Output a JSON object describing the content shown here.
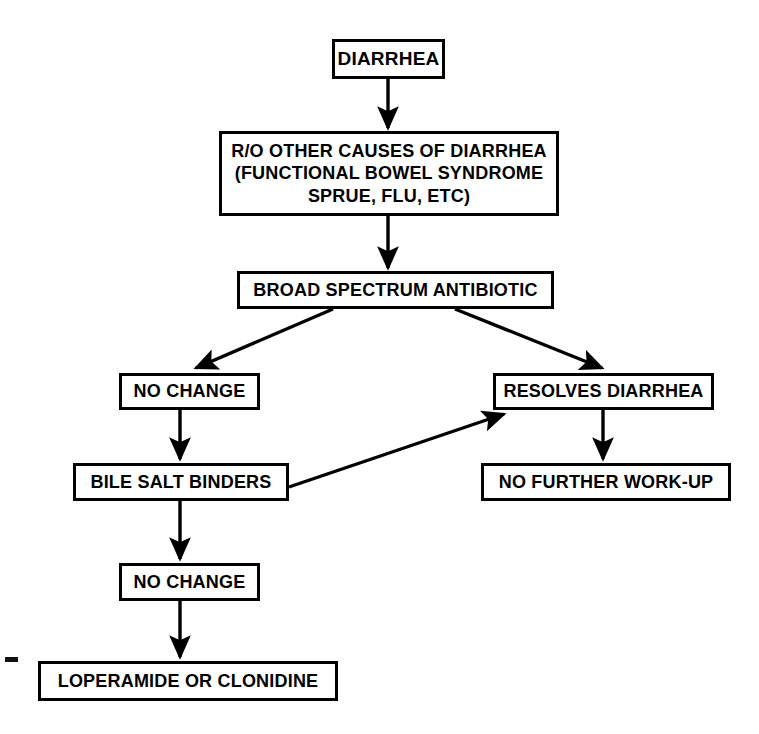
{
  "diagram": {
    "type": "flowchart",
    "background_color": "#ffffff",
    "line_color": "#000000",
    "text_color": "#000000",
    "nodes": [
      {
        "id": "diarrhea",
        "label": "DIARRHEA",
        "x": 332,
        "y": 39,
        "w": 113,
        "h": 40,
        "font_size": 19
      },
      {
        "id": "rule-out",
        "label": "R/O OTHER CAUSES OF DIARRHEA\n(FUNCTIONAL BOWEL SYNDROME\nSPRUE, FLU, ETC)",
        "x": 219,
        "y": 131,
        "w": 340,
        "h": 85,
        "font_size": 18
      },
      {
        "id": "broad-spectrum-antibiotic",
        "label": "BROAD SPECTRUM ANTIBIOTIC",
        "x": 237,
        "y": 271,
        "w": 317,
        "h": 38,
        "font_size": 18
      },
      {
        "id": "no-change-1",
        "label": "NO CHANGE",
        "x": 119,
        "y": 373,
        "w": 141,
        "h": 37,
        "font_size": 18
      },
      {
        "id": "resolves-diarrhea",
        "label": "RESOLVES DIARRHEA",
        "x": 493,
        "y": 373,
        "w": 221,
        "h": 37,
        "font_size": 18
      },
      {
        "id": "bile-salt-binders",
        "label": "BILE SALT BINDERS",
        "x": 73,
        "y": 463,
        "w": 216,
        "h": 38,
        "font_size": 18
      },
      {
        "id": "no-further-work-up",
        "label": "NO FURTHER WORK-UP",
        "x": 481,
        "y": 463,
        "w": 250,
        "h": 38,
        "font_size": 18
      },
      {
        "id": "no-change-2",
        "label": "NO CHANGE",
        "x": 119,
        "y": 563,
        "w": 141,
        "h": 38,
        "font_size": 18
      },
      {
        "id": "loperamide-or-clonidine",
        "label": "LOPERAMIDE OR CLONIDINE",
        "x": 38,
        "y": 661,
        "w": 300,
        "h": 40,
        "font_size": 18
      }
    ],
    "edges": [
      {
        "id": "edge-diarrhea-to-rule-out",
        "from": "diarrhea",
        "to": "rule-out",
        "x1": 388,
        "y1": 79,
        "x2": 388,
        "y2": 128
      },
      {
        "id": "edge-rule-out-to-antibiotic",
        "from": "rule-out",
        "to": "broad-spectrum-antibiotic",
        "x1": 388,
        "y1": 216,
        "x2": 388,
        "y2": 268
      },
      {
        "id": "edge-antibiotic-to-no-change",
        "from": "broad-spectrum-antibiotic",
        "to": "no-change-1",
        "x1": 333,
        "y1": 309,
        "x2": 196,
        "y2": 368
      },
      {
        "id": "edge-antibiotic-to-resolves",
        "from": "broad-spectrum-antibiotic",
        "to": "resolves-diarrhea",
        "x1": 455,
        "y1": 309,
        "x2": 602,
        "y2": 368
      },
      {
        "id": "edge-no-change-to-bile-salt",
        "from": "no-change-1",
        "to": "bile-salt-binders",
        "x1": 180,
        "y1": 410,
        "x2": 180,
        "y2": 459
      },
      {
        "id": "edge-bile-salt-to-resolves",
        "from": "bile-salt-binders",
        "to": "resolves-diarrhea",
        "x1": 289,
        "y1": 487,
        "x2": 504,
        "y2": 414
      },
      {
        "id": "edge-resolves-to-no-further",
        "from": "resolves-diarrhea",
        "to": "no-further-work-up",
        "x1": 603,
        "y1": 410,
        "x2": 603,
        "y2": 459
      },
      {
        "id": "edge-bile-salt-to-no-change-2",
        "from": "bile-salt-binders",
        "to": "no-change-2",
        "x1": 180,
        "y1": 501,
        "x2": 180,
        "y2": 559
      },
      {
        "id": "edge-no-change-2-to-loperamide",
        "from": "no-change-2",
        "to": "loperamide-or-clonidine",
        "x1": 180,
        "y1": 601,
        "x2": 180,
        "y2": 657
      }
    ],
    "artifact": {
      "id": "scan-speck",
      "x": 5,
      "y": 657,
      "w": 13,
      "h": 5
    }
  }
}
